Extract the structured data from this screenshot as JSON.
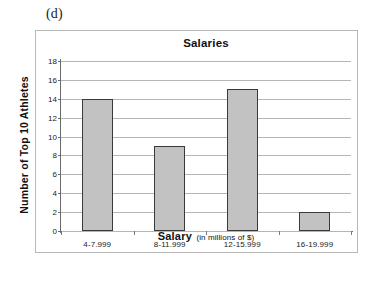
{
  "figure": {
    "panel_label": "(d)"
  },
  "chart_data": {
    "type": "bar",
    "title": "Salaries",
    "xlabel": "Salary",
    "xlabel_suffix": "(in millions of $)",
    "ylabel": "Number of Top 10 Athletes",
    "categories": [
      "4-7.999",
      "8-11.999",
      "12-15.999",
      "16-19.999"
    ],
    "values": [
      14,
      9,
      15,
      2
    ],
    "ylim": [
      0,
      18
    ],
    "ytick_step": 2,
    "yticks": [
      0,
      2,
      4,
      6,
      8,
      10,
      12,
      14,
      16,
      18
    ],
    "grid": true,
    "legend": false,
    "bar_fill_color": "#c2c2c2",
    "bar_border_color": "#3a3a3a",
    "gridline_color": "#b5b5b5",
    "axis_color": "#6a6a6a",
    "frame_color": "#b9b9b9",
    "background_color": "#ffffff"
  }
}
